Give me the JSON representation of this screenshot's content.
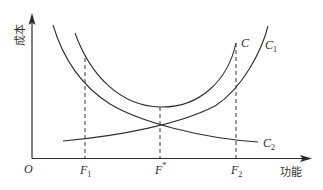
{
  "axes": {
    "y_label": "成本",
    "x_label": "功能",
    "origin_label": "O"
  },
  "curves": {
    "C": {
      "label": "C",
      "description": "total cost (U-shaped)",
      "path": "M75,33 C90,75 120,106 160,107 C200,108 228,80 236,43"
    },
    "C1": {
      "label_main": "C",
      "label_sub": "1",
      "description": "rising cost curve",
      "path": "M63,141 C120,136 180,124 215,106 C243,88 262,50 268,26"
    },
    "C2": {
      "label_main": "C",
      "label_sub": "2",
      "description": "falling cost curve",
      "path": "M53,25 C62,55 80,85 110,104 C140,122 200,138 258,142"
    }
  },
  "markers": [
    {
      "id": "F1",
      "label_main": "F",
      "label_sub": "1",
      "x": 85,
      "y_top": 58
    },
    {
      "id": "Fstar",
      "label_main": "F",
      "label_sup": "*",
      "x": 160,
      "y_top": 107
    },
    {
      "id": "F2",
      "label_main": "F",
      "label_sub": "2",
      "x": 236,
      "y_top": 43
    }
  ]
}
